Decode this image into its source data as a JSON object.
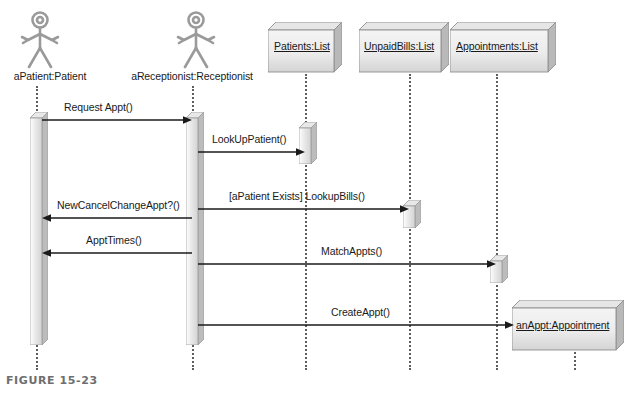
{
  "figure": {
    "caption": "FIGURE 15-23",
    "width": 628,
    "height": 397
  },
  "colors": {
    "line": "#1a1a1a",
    "lifeline": "#5e5e5e",
    "box_face_light": "#f2f2f2",
    "box_face_dark": "#d9d9d9",
    "box_side": "#b4b4b4",
    "box_top": "#e2e2e2",
    "box_stroke": "#8a8a8a",
    "actor_stroke": "#9a9a9a",
    "caption_color": "#6e6e6e",
    "text": "#1a1a1a"
  },
  "participants": [
    {
      "id": "patient",
      "label": "aPatient:Patient",
      "kind": "actor",
      "underline": false,
      "lifeline_x": 36
    },
    {
      "id": "receptionist",
      "label": "aReceptionist:Receptionist",
      "kind": "actor",
      "underline": false,
      "lifeline_x": 192
    },
    {
      "id": "patients_list",
      "label": "Patients:List",
      "kind": "object",
      "underline": true,
      "lifeline_x": 305
    },
    {
      "id": "unpaid_bills",
      "label": "UnpaidBills:List",
      "kind": "object",
      "underline": true,
      "lifeline_x": 409
    },
    {
      "id": "appointments",
      "label": "Appointments:List",
      "kind": "object",
      "underline": true,
      "lifeline_x": 496
    },
    {
      "id": "an_appt",
      "label": "anAppt:Appointment",
      "kind": "created-object",
      "underline": true,
      "lifeline_x": 574
    }
  ],
  "messages": [
    {
      "id": "m1",
      "label": "Request Appt()",
      "from": "patient",
      "to": "receptionist",
      "direction": "right",
      "y": 120
    },
    {
      "id": "m2",
      "label": "LookUpPatient()",
      "from": "receptionist",
      "to": "patients_list",
      "direction": "right",
      "y": 152
    },
    {
      "id": "m3",
      "label": "[aPatient Exists] LookupBills()",
      "from": "receptionist",
      "to": "unpaid_bills",
      "direction": "right",
      "y": 209
    },
    {
      "id": "m4",
      "label": "NewCancelChangeAppt?()",
      "from": "receptionist",
      "to": "patient",
      "direction": "left",
      "y": 218
    },
    {
      "id": "m5",
      "label": "ApptTimes()",
      "from": "receptionist",
      "to": "patient",
      "direction": "left",
      "y": 253
    },
    {
      "id": "m6",
      "label": "MatchAppts()",
      "from": "receptionist",
      "to": "appointments",
      "direction": "right",
      "y": 264
    },
    {
      "id": "m7",
      "label": "CreateAppt()",
      "from": "receptionist",
      "to": "an_appt",
      "direction": "right",
      "y": 325
    }
  ],
  "activations": [
    {
      "id": "a-patient",
      "participant": "patient",
      "top": 112,
      "height": 233
    },
    {
      "id": "a-receptionist",
      "participant": "receptionist",
      "top": 112,
      "height": 233
    },
    {
      "id": "a-patients",
      "participant": "patients_list",
      "top": 122,
      "height": 42
    },
    {
      "id": "a-bills",
      "participant": "unpaid_bills",
      "top": 200,
      "height": 28
    },
    {
      "id": "a-appts",
      "participant": "appointments",
      "top": 255,
      "height": 28
    }
  ]
}
